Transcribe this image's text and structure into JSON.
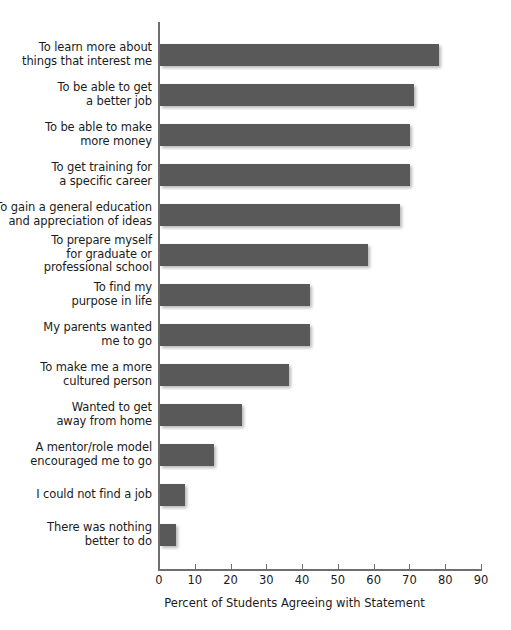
{
  "chart_data": {
    "type": "bar",
    "orientation": "horizontal",
    "title": "",
    "xlabel": "Percent of Students Agreeing with Statement",
    "ylabel": "",
    "xlim": [
      0,
      90
    ],
    "xticks": [
      0,
      10,
      20,
      30,
      40,
      50,
      60,
      70,
      80,
      90
    ],
    "grid": false,
    "legend": null,
    "bar_color": "#595959",
    "axis_color": "#6e6e6e",
    "categories": [
      "To learn more about\nthings that interest me",
      "To be able to get\na better job",
      "To be able to make\nmore money",
      "To get training for\na specific career",
      "To gain a general education\nand appreciation of ideas",
      "To prepare myself\nfor graduate or\nprofessional school",
      "To find my\npurpose in life",
      "My parents wanted\nme to go",
      "To make me a more\ncultured person",
      "Wanted to get\naway from home",
      "A mentor/role model\nencouraged me to go",
      "I could not find a job",
      "There was nothing\nbetter to do"
    ],
    "values": [
      78,
      71,
      70,
      70,
      67,
      58,
      42,
      42,
      36,
      23,
      15,
      7,
      4.5
    ]
  },
  "bars": [
    {
      "label": "To learn more about\nthings that interest me",
      "value": 78,
      "lines": 2
    },
    {
      "label": "To be able to get\na better job",
      "value": 71,
      "lines": 2
    },
    {
      "label": "To be able to make\nmore money",
      "value": 70,
      "lines": 2
    },
    {
      "label": "To get training for\na specific career",
      "value": 70,
      "lines": 2
    },
    {
      "label": "To gain a general education\nand appreciation of ideas",
      "value": 67,
      "lines": 2
    },
    {
      "label": "To prepare myself\nfor graduate or\nprofessional school",
      "value": 58,
      "lines": 3
    },
    {
      "label": "To find my\npurpose in life",
      "value": 42,
      "lines": 2
    },
    {
      "label": "My parents wanted\nme to go",
      "value": 42,
      "lines": 2
    },
    {
      "label": "To make me a more\ncultured person",
      "value": 36,
      "lines": 2
    },
    {
      "label": "Wanted to get\naway from home",
      "value": 23,
      "lines": 2
    },
    {
      "label": "A mentor/role model\nencouraged me to go",
      "value": 15,
      "lines": 2
    },
    {
      "label": "I could not find a job",
      "value": 7,
      "lines": 1
    },
    {
      "label": "There was nothing\nbetter to do",
      "value": 4.5,
      "lines": 2
    }
  ],
  "axis": {
    "ticks": [
      "0",
      "10",
      "20",
      "30",
      "40",
      "50",
      "60",
      "70",
      "80",
      "90"
    ],
    "title": "Percent of Students Agreeing with Statement"
  }
}
